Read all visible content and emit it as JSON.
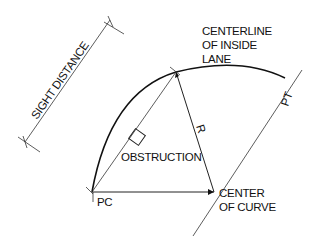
{
  "diagram": {
    "type": "sight-distance-on-horizontal-curve",
    "labels": {
      "sight_distance": "SIGHT DISTANCE",
      "centerline": [
        "CENTERLINE",
        "OF INSIDE",
        "LANE"
      ],
      "pt": "PT",
      "radius": "R",
      "obstruction": "OBSTRUCTION",
      "pc": "PC",
      "center": [
        "CENTER",
        "OF CURVE"
      ]
    },
    "colors": {
      "line": "#222222",
      "background": "#ffffff"
    }
  }
}
